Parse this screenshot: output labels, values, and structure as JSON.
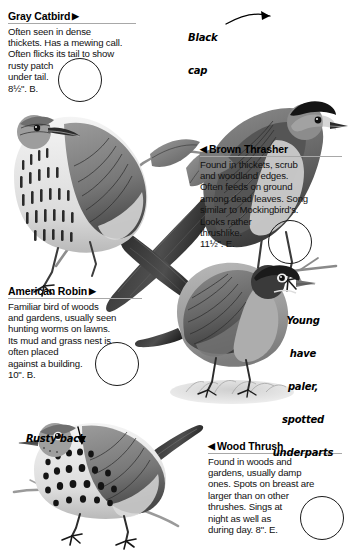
{
  "page": {
    "width": 348,
    "height": 550,
    "background": "#ffffff",
    "kind": "field-guide-page"
  },
  "entries": [
    {
      "id": "gray-catbird",
      "heading": "Gray Catbird",
      "marker": "▶",
      "marker_side": "right",
      "body": "Often seen in dense thickets. Has a mewing call. Often flicks its tail to show rusty patch under tail.",
      "size": "8½\". B.",
      "full_text": "Often seen in dense thickets. Has a mewing call. Often flicks its tail to show rusty patch under tail. 8½\". B.",
      "lines": [
        "Often seen in dense",
        "thickets. Has a mewing call.",
        "Often flicks its tail to show",
        "rusty patch",
        "under tail.",
        "8½\". B."
      ]
    },
    {
      "id": "brown-thrasher",
      "heading": "Brown Thrasher",
      "marker": "◀",
      "marker_side": "left",
      "body": "Found in thickets, scrub and woodland edges. Often feeds on ground among dead leaves. Song similar to Mockingbird's. Looks rather thrushlike.",
      "size": "11½\". E.",
      "full_text": "Found in thickets, scrub and woodland edges. Often feeds on ground among dead leaves. Song similar to Mockingbird's. Looks rather thrushlike. 11½\". E.",
      "lines": [
        "Found in thickets, scrub",
        "and woodland edges.",
        "Often feeds on ground",
        "among dead leaves. Song",
        "similar to Mockingbird's.",
        "Looks rather",
        "thrushlike.",
        "11½\". E."
      ]
    },
    {
      "id": "american-robin",
      "heading": "American Robin",
      "marker": "▶",
      "marker_side": "right",
      "body": "Familiar bird of woods and gardens, usually seen hunting worms on lawns. Its mud and grass nest is often placed against a building.",
      "size": "10\". B.",
      "full_text": "Familiar bird of woods and gardens, usually seen hunting worms on lawns. Its mud and grass nest is often placed against a building. 10\". B.",
      "lines": [
        "Familiar bird of woods",
        "and gardens, usually seen",
        "hunting worms on lawns.",
        "Its mud and grass nest is",
        "often placed",
        "against a building.",
        "10\". B."
      ]
    },
    {
      "id": "wood-thrush",
      "heading": "Wood Thrush",
      "marker": "◀",
      "marker_side": "left",
      "body": "Found in woods and gardens, usually damp ones. Spots on breast are larger than on other thrushes. Sings at night as well as during day.",
      "size": "8\". E.",
      "full_text": "Found in woods and gardens, usually damp ones. Spots on breast are larger than on other thrushes. Sings at night as well as during day. 8\". E.",
      "lines": [
        "Found in woods and",
        "gardens, usually damp",
        "ones. Spots on breast are",
        "larger than on other",
        "thrushes. Sings at",
        "night as well as",
        "during day. 8\". E."
      ]
    }
  ],
  "annotations": [
    {
      "id": "black-cap",
      "lines": [
        "Black",
        "cap"
      ],
      "text": "Black cap",
      "points_to": "gray-catbird-crown",
      "arrow": "curved-right"
    },
    {
      "id": "young-have-paler-spotted-underparts",
      "lines": [
        "Young",
        "have",
        "paler,",
        "spotted",
        "underparts"
      ],
      "text": "Young have paler, spotted underparts",
      "points_to": "american-robin-underparts",
      "arrow": "none"
    },
    {
      "id": "rusty-back",
      "lines": [
        "Rusty back"
      ],
      "text": "Rusty back",
      "points_to": "wood-thrush-back",
      "arrow": "straight-down"
    }
  ],
  "illustrations": [
    {
      "id": "gray-catbird-art",
      "label": "Gray Catbird illustration",
      "description": "dark gray bird with black cap perched on twig, long tail to lower left"
    },
    {
      "id": "brown-thrasher-art",
      "label": "Brown Thrasher illustration",
      "description": "streaked rufous bird on leafy branch facing left, long tail to lower right"
    },
    {
      "id": "american-robin-art",
      "label": "American Robin illustration",
      "description": "robin standing on grassy ground facing right"
    },
    {
      "id": "wood-thrush-art",
      "label": "Wood Thrush illustration",
      "description": "boldly spotted thrush on branch facing left"
    }
  ],
  "range_circles": [
    {
      "id": "range-circle-gray-catbird"
    },
    {
      "id": "range-circle-brown-thrasher"
    },
    {
      "id": "range-circle-american-robin"
    },
    {
      "id": "range-circle-wood-thrush"
    }
  ]
}
